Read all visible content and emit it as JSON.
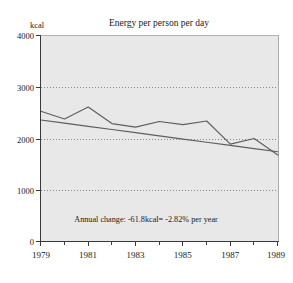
{
  "chart_data": {
    "type": "line",
    "title": "Energy per person per day",
    "xlabel": "",
    "ylabel": "kcal",
    "ylim": [
      0,
      4000
    ],
    "xlim": [
      1979,
      1989
    ],
    "ytick_labels": [
      "0",
      "1000",
      "2000",
      "3000",
      "4000"
    ],
    "ytick_values": [
      0,
      1000,
      2000,
      3000,
      4000
    ],
    "xtick_labels": [
      "1979",
      "1981",
      "1983",
      "1985",
      "1987",
      "1989"
    ],
    "xtick_values": [
      1979,
      1981,
      1983,
      1985,
      1987,
      1989
    ],
    "x_minor_ticks": [
      1980,
      1982,
      1984,
      1986,
      1988
    ],
    "grid": "horizontal-dotted",
    "gridline_values": [
      1000,
      2000,
      3000
    ],
    "legend": "none",
    "x": [
      1979,
      1980,
      1981,
      1982,
      1983,
      1984,
      1985,
      1986,
      1987,
      1988,
      1989
    ],
    "series": [
      {
        "name": "Energy per person per day",
        "values": [
          2530,
          2380,
          2610,
          2290,
          2220,
          2330,
          2270,
          2340,
          1890,
          2000,
          1680
        ]
      },
      {
        "name": "Linear trend",
        "values": [
          2360,
          2298,
          2236,
          2175,
          2113,
          2051,
          1989,
          1927,
          1866,
          1804,
          1742
        ]
      }
    ],
    "annotations": [
      {
        "text": "Annual change: -61.8kcal= -2.82% per year",
        "x": 1984,
        "y": 600
      }
    ],
    "colors": {
      "plot_background": "#e8e8e8",
      "page_background": "#ffffff",
      "series_line": "#5e5e5e",
      "axis": "#3a3a3a",
      "gridline": "#7d7d7d",
      "text": "#1a1a1a"
    }
  }
}
